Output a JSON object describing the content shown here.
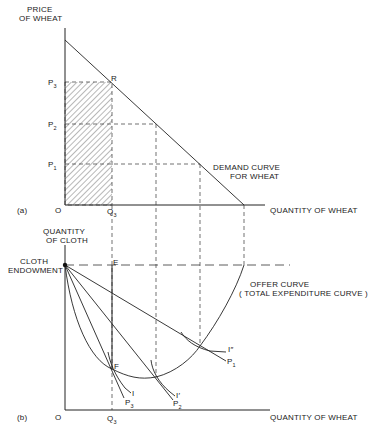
{
  "panel_a": {
    "tag": "(a)",
    "origin": "O",
    "y_axis_label_1": "PRICE",
    "y_axis_label_2": "OF WHEAT",
    "x_axis_label": "QUANTITY OF WHEAT",
    "price_labels": [
      {
        "base": "P",
        "sub": "3"
      },
      {
        "base": "P",
        "sub": "2"
      },
      {
        "base": "P",
        "sub": "1"
      }
    ],
    "point_R": "R",
    "q3": {
      "base": "Q",
      "sub": "3"
    },
    "demand_label_1": "DEMAND CURVE",
    "demand_label_2": "FOR WHEAT"
  },
  "panel_b": {
    "tag": "(b)",
    "origin": "O",
    "y_axis_label_1": "QUANTITY",
    "y_axis_label_2": "OF CLOTH",
    "endowment_label_1": "CLOTH",
    "endowment_label_2": "ENDOWMENT",
    "x_axis_label": "QUANTITY OF WHEAT",
    "point_E": "E",
    "point_F": "F",
    "q3": {
      "base": "Q",
      "sub": "3"
    },
    "offer_label_1": "OFFER CURVE",
    "offer_label_2": "( TOTAL EXPENDITURE CURVE )",
    "indiff_labels": [
      "I",
      "I′",
      "I″"
    ],
    "price_line_labels": [
      {
        "base": "P",
        "sub": "3"
      },
      {
        "base": "P",
        "sub": "2"
      },
      {
        "base": "P",
        "sub": "1"
      }
    ]
  }
}
